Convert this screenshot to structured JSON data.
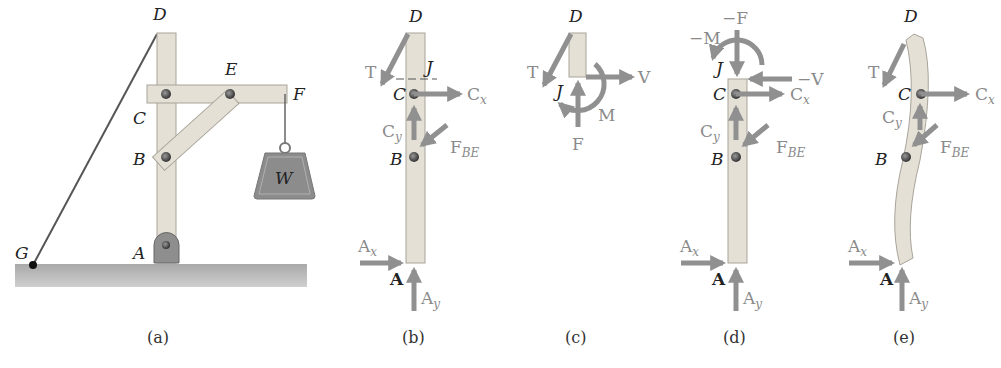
{
  "figure": {
    "panels": [
      {
        "id": "a",
        "caption": "(a)",
        "points": {
          "D": "D",
          "E": "E",
          "F": "F",
          "C": "C",
          "B": "B",
          "A": "A",
          "G": "G"
        },
        "weight_label": "W"
      },
      {
        "id": "b",
        "caption": "(b)",
        "points": {
          "D": "D",
          "J": "J",
          "C": "C",
          "B": "B",
          "A": "A"
        },
        "forces": {
          "T": "T",
          "Cx": "C",
          "Cx_sub": "x",
          "Cy": "C",
          "Cy_sub": "y",
          "FBE": "F",
          "FBE_sub": "BE",
          "Ax": "A",
          "Ax_sub": "x",
          "Ay": "A",
          "Ay_sub": "y"
        }
      },
      {
        "id": "c",
        "caption": "(c)",
        "points": {
          "D": "D",
          "J": "J"
        },
        "forces": {
          "T": "T",
          "V": "V",
          "M": "M",
          "F": "F"
        }
      },
      {
        "id": "d",
        "caption": "(d)",
        "points": {
          "J": "J",
          "C": "C",
          "B": "B",
          "A": "A"
        },
        "forces": {
          "negM": "−M",
          "negF": "−F",
          "negV": "−V",
          "Cx": "C",
          "Cx_sub": "x",
          "Cy": "C",
          "Cy_sub": "y",
          "FBE": "F",
          "FBE_sub": "BE",
          "Ax": "A",
          "Ax_sub": "x",
          "Ay": "A",
          "Ay_sub": "y"
        }
      },
      {
        "id": "e",
        "caption": "(e)",
        "points": {
          "D": "D",
          "C": "C",
          "B": "B",
          "A": "A"
        },
        "forces": {
          "T": "T",
          "Cx": "C",
          "Cx_sub": "x",
          "Cy": "C",
          "Cy_sub": "y",
          "FBE": "F",
          "FBE_sub": "BE",
          "Ax": "A",
          "Ax_sub": "x",
          "Ay": "A",
          "Ay_sub": "y"
        }
      }
    ],
    "colors": {
      "wood": "#e4e0d6",
      "arrow": "#909090",
      "ground": "#bdbdbd",
      "weight": "#8c8c8c",
      "pin": "#555555"
    }
  }
}
